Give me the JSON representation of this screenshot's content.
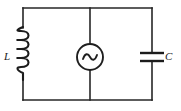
{
  "figure": {
    "background_color": "#ffffff",
    "line_color": "#262626",
    "width": 181,
    "height": 111
  },
  "labels": {
    "inductor": "L",
    "capacitor": "C"
  },
  "components": [
    {
      "id": "inductor",
      "name": "inductor",
      "symbol": "coil",
      "label": "L",
      "label_position": "left",
      "turns": 4,
      "branch": "left"
    },
    {
      "id": "ac-source",
      "name": "ac-voltage-source",
      "symbol": "circle-with-sine",
      "label": "",
      "branch": "middle"
    },
    {
      "id": "capacitor",
      "name": "capacitor",
      "symbol": "parallel-plates",
      "label": "C",
      "label_position": "right",
      "plates": 2,
      "branch": "right"
    }
  ],
  "geometry": {
    "left_rail_x": 23,
    "middle_rail_x": 90,
    "right_rail_x": 152,
    "top_rail_y": 8,
    "bottom_rail_y": 100,
    "source_center": [
      90,
      57
    ],
    "source_radius": 13,
    "capacitor_plate_top_y": 53,
    "capacitor_plate_bottom_y": 61,
    "capacitor_plate_half_width": 12,
    "coil_top_y": 27,
    "coil_bottom_y": 80,
    "coil_turns": 4
  }
}
